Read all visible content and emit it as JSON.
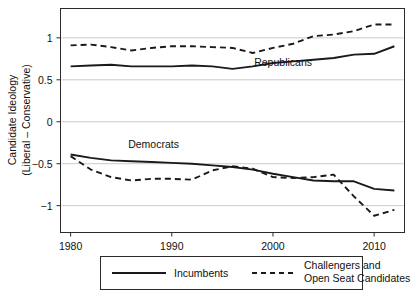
{
  "chart_data": {
    "type": "line",
    "title": "",
    "xlabel": "",
    "ylabel": "Candidate Ideology (Liberal – Conservative)",
    "ylabel_line1": "Candidate Ideology",
    "ylabel_line2": "(Liberal – Conservative)",
    "xlim": [
      1979,
      2013
    ],
    "ylim": [
      -1.32,
      1.35
    ],
    "yticks": [
      1,
      0.5,
      0,
      -0.5,
      -1
    ],
    "ytick_labels": [
      "1",
      "0.5",
      "0",
      "−0.5",
      "−1"
    ],
    "xticks": [
      1980,
      1990,
      2000,
      2010
    ],
    "xtick_labels": [
      "1980",
      "1990",
      "2000",
      "2010"
    ],
    "grid": "horizontal",
    "legend_position": "below-plot",
    "annotations": [
      {
        "text": "Republicans",
        "x": 2001.0,
        "y": 0.66
      },
      {
        "text": "Democrats",
        "x": 1988.2,
        "y": -0.31
      }
    ],
    "series": [
      {
        "name": "Republican Incumbents",
        "party": "Republican",
        "style": "solid",
        "color": "#1a1a1a",
        "x": [
          1980,
          1982,
          1984,
          1986,
          1988,
          1990,
          1992,
          1994,
          1996,
          1998,
          2000,
          2002,
          2004,
          2006,
          2008,
          2010,
          2012
        ],
        "values": [
          0.66,
          0.67,
          0.68,
          0.66,
          0.66,
          0.66,
          0.67,
          0.66,
          0.63,
          0.66,
          0.7,
          0.72,
          0.74,
          0.76,
          0.8,
          0.81,
          0.9
        ]
      },
      {
        "name": "Republican Challengers and Open Seat Candidates",
        "party": "Republican",
        "style": "dashed",
        "color": "#1a1a1a",
        "x": [
          1980,
          1982,
          1984,
          1986,
          1988,
          1990,
          1992,
          1994,
          1996,
          1998,
          2000,
          2002,
          2004,
          2006,
          2008,
          2010,
          2012
        ],
        "values": [
          0.91,
          0.92,
          0.89,
          0.85,
          0.88,
          0.9,
          0.9,
          0.89,
          0.88,
          0.82,
          0.88,
          0.93,
          1.02,
          1.04,
          1.08,
          1.16,
          1.16
        ]
      },
      {
        "name": "Democratic Incumbents",
        "party": "Democrat",
        "style": "solid",
        "color": "#1a1a1a",
        "x": [
          1980,
          1982,
          1984,
          1986,
          1988,
          1990,
          1992,
          1994,
          1996,
          1998,
          2000,
          2002,
          2004,
          2006,
          2008,
          2010,
          2012
        ],
        "values": [
          -0.39,
          -0.43,
          -0.46,
          -0.47,
          -0.48,
          -0.49,
          -0.5,
          -0.52,
          -0.54,
          -0.57,
          -0.62,
          -0.66,
          -0.7,
          -0.71,
          -0.71,
          -0.8,
          -0.82
        ]
      },
      {
        "name": "Democratic Challengers and Open Seat Candidates",
        "party": "Democrat",
        "style": "dashed",
        "color": "#1a1a1a",
        "x": [
          1980,
          1982,
          1984,
          1986,
          1988,
          1990,
          1992,
          1994,
          1996,
          1998,
          2000,
          2002,
          2004,
          2006,
          2008,
          2010,
          2012
        ],
        "values": [
          -0.41,
          -0.57,
          -0.66,
          -0.7,
          -0.68,
          -0.68,
          -0.69,
          -0.58,
          -0.53,
          -0.56,
          -0.66,
          -0.67,
          -0.66,
          -0.63,
          -0.89,
          -1.12,
          -1.05
        ]
      }
    ]
  },
  "legend": {
    "items": [
      {
        "label": "Incumbents",
        "style": "solid"
      },
      {
        "label": "Challengers and Open Seat Candidates",
        "style": "dashed",
        "line1": "Challengers and",
        "line2": "Open Seat Candidates"
      }
    ]
  }
}
